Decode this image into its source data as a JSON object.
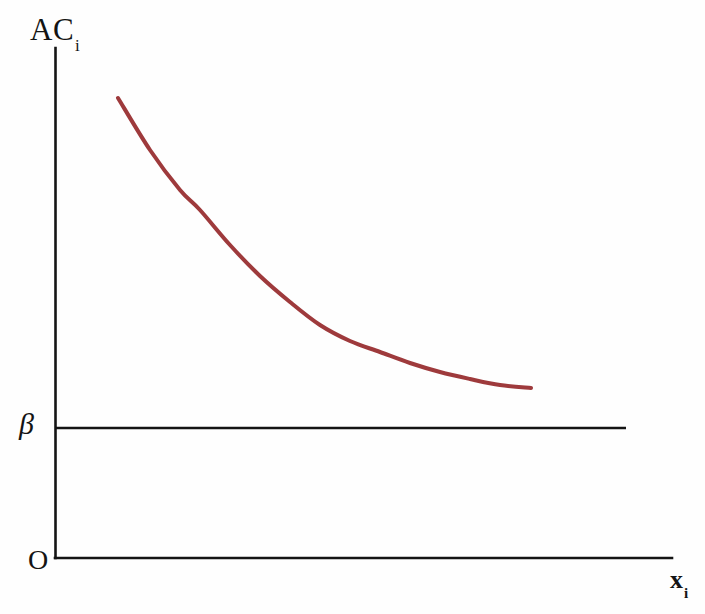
{
  "figure": {
    "background_color": "#fefefe",
    "width": 705,
    "height": 614
  },
  "labels": {
    "y_axis_main": "AC",
    "y_axis_sub": "i",
    "x_axis_main": "x",
    "x_axis_sub": "i",
    "origin": "O",
    "beta": "β"
  },
  "colors": {
    "axis": "#141414",
    "curve": "#9e3a3c",
    "beta_line": "#141414",
    "background": "#fefefe"
  },
  "chart_data": {
    "type": "line",
    "title": "",
    "xlabel": "x_i",
    "ylabel": "AC_i",
    "grid": false,
    "legend": null,
    "axes": {
      "origin_px": [
        55,
        558
      ],
      "y_axis_top_px": [
        55,
        48
      ],
      "x_axis_right_px": [
        672,
        558
      ],
      "arrowheads": false
    },
    "annotations": [
      {
        "name": "beta-level-line",
        "label": "β",
        "type": "horizontal-line",
        "y_px": 428,
        "x_start_px": 55,
        "x_end_px": 626,
        "color": "#141414",
        "stroke_width": 2.6
      }
    ],
    "series": [
      {
        "name": "AC_i",
        "style": "smooth-decreasing-convex",
        "color": "#9e3a3c",
        "stroke_width": 4,
        "points_px": [
          [
            118,
            98
          ],
          [
            150,
            150
          ],
          [
            180,
            190
          ],
          [
            200,
            210
          ],
          [
            230,
            245
          ],
          [
            260,
            276
          ],
          [
            290,
            302
          ],
          [
            320,
            325
          ],
          [
            350,
            341
          ],
          [
            380,
            352
          ],
          [
            410,
            363
          ],
          [
            440,
            372
          ],
          [
            470,
            379
          ],
          [
            500,
            385
          ],
          [
            531,
            388
          ]
        ],
        "asymptote_note": "approaches but stays above the β line"
      }
    ]
  }
}
